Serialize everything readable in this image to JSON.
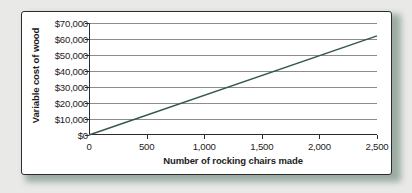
{
  "chart_data": {
    "type": "line",
    "title": "",
    "xlabel": "Number of rocking chairs made",
    "ylabel": "Variable cost of wood",
    "xlim": [
      0,
      2500
    ],
    "ylim": [
      0,
      70000
    ],
    "grid": true,
    "legend": false,
    "line_color": "#35574a",
    "x": [
      0,
      2500
    ],
    "series": [
      {
        "name": "Variable cost of wood",
        "values": [
          0,
          62000
        ]
      }
    ],
    "xticks": [
      {
        "value": 0,
        "label": "0"
      },
      {
        "value": 500,
        "label": "500"
      },
      {
        "value": 1000,
        "label": "1,000"
      },
      {
        "value": 1500,
        "label": "1,500"
      },
      {
        "value": 2000,
        "label": "2,000"
      },
      {
        "value": 2500,
        "label": "2,500"
      }
    ],
    "yticks": [
      {
        "value": 0,
        "label": "$0"
      },
      {
        "value": 10000,
        "label": "$10,000"
      },
      {
        "value": 20000,
        "label": "$20,000"
      },
      {
        "value": 30000,
        "label": "$30,000"
      },
      {
        "value": 40000,
        "label": "$40,000"
      },
      {
        "value": 50000,
        "label": "$50,000"
      },
      {
        "value": 60000,
        "label": "$60,000"
      },
      {
        "value": 70000,
        "label": "$70,000"
      }
    ]
  }
}
